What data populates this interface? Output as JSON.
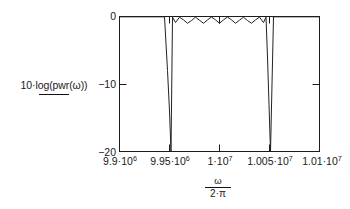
{
  "figure": {
    "background_color": "#ffffff",
    "line_color": "#1b1b1b",
    "trace_color": "#222222"
  },
  "y_legend": {
    "text": "10·log(pwr(ω))",
    "underline": true
  },
  "x_axis_title": {
    "numerator": "ω",
    "denominator": "2·π",
    "as_text": "ω / (2·π)"
  },
  "y_ticks": [
    {
      "label": "0",
      "value": 0
    },
    {
      "label": "−10",
      "value": -10
    },
    {
      "label": "−20",
      "value": -20
    }
  ],
  "x_ticks": [
    {
      "mantissa": "9.9",
      "exponent": "6",
      "label": "9.9·10⁶",
      "value": 9900000
    },
    {
      "mantissa": "9.95",
      "exponent": "6",
      "label": "9.95·10⁶",
      "value": 9950000
    },
    {
      "mantissa": "1",
      "exponent": "7",
      "label": "1·10⁷",
      "value": 10000000
    },
    {
      "mantissa": "1.005",
      "exponent": "7",
      "label": "1.005·10⁷",
      "value": 10050000
    },
    {
      "mantissa": "1.01",
      "exponent": "7",
      "label": "1.01·10⁷",
      "value": 10100000
    }
  ],
  "chart_data": {
    "type": "line",
    "title": "",
    "subtitle": "",
    "xlabel": "ω / (2·π)",
    "ylabel": "10·log(pwr(ω))",
    "xlim": [
      9900000,
      10100000
    ],
    "ylim": [
      -20,
      0
    ],
    "xticks": [
      9900000,
      9950000,
      10000000,
      10050000,
      10100000
    ],
    "xticklabels": [
      "9.9·10⁶",
      "9.95·10⁶",
      "1·10⁷",
      "1.005·10⁷",
      "1.01·10⁷"
    ],
    "yticks": [
      0,
      -10,
      -20
    ],
    "yticklabels": [
      "0",
      "−10",
      "−20"
    ],
    "grid": false,
    "legend": "none",
    "series": [
      {
        "name": "10·log(pwr(ω))",
        "x": [
          9900000,
          9930000,
          9945000,
          9948000,
          9950000,
          9951500,
          9953000,
          9956000,
          9960000,
          9964000,
          9968000,
          9972000,
          9976000,
          9980000,
          9984000,
          9988000,
          9992000,
          9996000,
          10000000,
          10004000,
          10008000,
          10012000,
          10016000,
          10020000,
          10024000,
          10028000,
          10032000,
          10036000,
          10040000,
          10044000,
          10046500,
          10048000,
          10049500,
          10051000,
          10054000,
          10060000,
          10075000,
          10100000
        ],
        "y": [
          -0.05,
          -0.05,
          -0.05,
          -8.0,
          -14.0,
          -20.0,
          -0.1,
          -0.9,
          -0.1,
          -0.5,
          -1.0,
          -0.6,
          -0.1,
          -0.55,
          -1.0,
          -0.5,
          -0.08,
          -0.5,
          -1.0,
          -0.5,
          -0.08,
          -0.5,
          -1.0,
          -0.55,
          -0.1,
          -0.6,
          -1.0,
          -0.5,
          -0.1,
          -0.9,
          -0.1,
          -6.0,
          -13.0,
          -20.0,
          -0.05,
          -0.05,
          -0.05,
          -0.05
        ]
      }
    ]
  }
}
